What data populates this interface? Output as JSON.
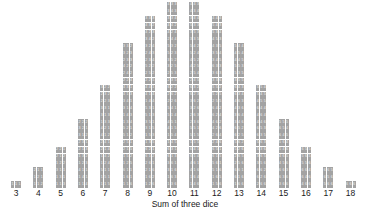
{
  "chart_data": {
    "type": "bar",
    "title": "",
    "subtitle": "",
    "xlabel": "Sum of three dice",
    "ylabel": "",
    "grid": false,
    "legend": null,
    "annotations": [],
    "xlim": [
      3,
      18
    ],
    "ylim": [
      0,
      27
    ],
    "categories": [
      3,
      4,
      5,
      6,
      7,
      8,
      9,
      10,
      11,
      12,
      13,
      14,
      15,
      16,
      17,
      18
    ],
    "tick_labels": [
      "3",
      "4",
      "5",
      "6",
      "7",
      "8",
      "9",
      "10",
      "11",
      "12",
      "13",
      "14",
      "15",
      "16",
      "17",
      "18"
    ],
    "values": [
      1,
      3,
      6,
      10,
      15,
      21,
      25,
      27,
      27,
      25,
      21,
      15,
      10,
      6,
      3,
      1
    ],
    "total_outcomes": 216,
    "note": "Each stacked square is one ordered outcome of three dice; the three digits in a square are the faces of die 1, die 2 and die 3.",
    "columns": [
      {
        "sum": 3,
        "count": 1,
        "outcomes": [
          [
            1,
            1,
            1
          ]
        ]
      },
      {
        "sum": 4,
        "count": 3,
        "outcomes": [
          [
            1,
            1,
            2
          ],
          [
            1,
            2,
            1
          ],
          [
            2,
            1,
            1
          ]
        ]
      },
      {
        "sum": 5,
        "count": 6,
        "outcomes": [
          [
            1,
            1,
            3
          ],
          [
            1,
            3,
            1
          ],
          [
            3,
            1,
            1
          ],
          [
            1,
            2,
            2
          ],
          [
            2,
            1,
            2
          ],
          [
            2,
            2,
            1
          ]
        ]
      },
      {
        "sum": 6,
        "count": 10,
        "outcomes": [
          [
            1,
            1,
            4
          ],
          [
            1,
            4,
            1
          ],
          [
            4,
            1,
            1
          ],
          [
            1,
            2,
            3
          ],
          [
            1,
            3,
            2
          ],
          [
            2,
            1,
            3
          ],
          [
            2,
            3,
            1
          ],
          [
            3,
            1,
            2
          ],
          [
            3,
            2,
            1
          ],
          [
            2,
            2,
            2
          ]
        ]
      },
      {
        "sum": 7,
        "count": 15,
        "outcomes": [
          [
            1,
            1,
            5
          ],
          [
            1,
            5,
            1
          ],
          [
            5,
            1,
            1
          ],
          [
            1,
            2,
            4
          ],
          [
            1,
            4,
            2
          ],
          [
            2,
            1,
            4
          ],
          [
            2,
            4,
            1
          ],
          [
            4,
            1,
            2
          ],
          [
            4,
            2,
            1
          ],
          [
            1,
            3,
            3
          ],
          [
            3,
            1,
            3
          ],
          [
            3,
            3,
            1
          ],
          [
            2,
            2,
            3
          ],
          [
            2,
            3,
            2
          ],
          [
            3,
            2,
            2
          ]
        ]
      },
      {
        "sum": 8,
        "count": 21,
        "outcomes": [
          [
            1,
            1,
            6
          ],
          [
            1,
            6,
            1
          ],
          [
            6,
            1,
            1
          ],
          [
            1,
            2,
            5
          ],
          [
            1,
            5,
            2
          ],
          [
            2,
            1,
            5
          ],
          [
            2,
            5,
            1
          ],
          [
            5,
            1,
            2
          ],
          [
            5,
            2,
            1
          ],
          [
            1,
            3,
            4
          ],
          [
            1,
            4,
            3
          ],
          [
            3,
            1,
            4
          ],
          [
            3,
            4,
            1
          ],
          [
            4,
            1,
            3
          ],
          [
            4,
            3,
            1
          ],
          [
            2,
            2,
            4
          ],
          [
            2,
            4,
            2
          ],
          [
            4,
            2,
            2
          ],
          [
            2,
            3,
            3
          ],
          [
            3,
            2,
            3
          ],
          [
            3,
            3,
            2
          ]
        ]
      },
      {
        "sum": 9,
        "count": 25,
        "outcomes": [
          [
            1,
            2,
            6
          ],
          [
            1,
            6,
            2
          ],
          [
            2,
            1,
            6
          ],
          [
            2,
            6,
            1
          ],
          [
            6,
            1,
            2
          ],
          [
            6,
            2,
            1
          ],
          [
            1,
            3,
            5
          ],
          [
            1,
            5,
            3
          ],
          [
            3,
            1,
            5
          ],
          [
            3,
            5,
            1
          ],
          [
            5,
            1,
            3
          ],
          [
            5,
            3,
            1
          ],
          [
            1,
            4,
            4
          ],
          [
            4,
            1,
            4
          ],
          [
            4,
            4,
            1
          ],
          [
            2,
            2,
            5
          ],
          [
            2,
            5,
            2
          ],
          [
            5,
            2,
            2
          ],
          [
            2,
            3,
            4
          ],
          [
            2,
            4,
            3
          ],
          [
            3,
            2,
            4
          ],
          [
            3,
            4,
            2
          ],
          [
            4,
            2,
            3
          ],
          [
            4,
            3,
            2
          ],
          [
            3,
            3,
            3
          ]
        ]
      },
      {
        "sum": 10,
        "count": 27,
        "outcomes": [
          [
            1,
            3,
            6
          ],
          [
            1,
            6,
            3
          ],
          [
            3,
            1,
            6
          ],
          [
            3,
            6,
            1
          ],
          [
            6,
            1,
            3
          ],
          [
            6,
            3,
            1
          ],
          [
            1,
            4,
            5
          ],
          [
            1,
            5,
            4
          ],
          [
            4,
            1,
            5
          ],
          [
            4,
            5,
            1
          ],
          [
            5,
            1,
            4
          ],
          [
            5,
            4,
            1
          ],
          [
            2,
            2,
            6
          ],
          [
            2,
            6,
            2
          ],
          [
            6,
            2,
            2
          ],
          [
            2,
            3,
            5
          ],
          [
            2,
            5,
            3
          ],
          [
            3,
            2,
            5
          ],
          [
            3,
            5,
            2
          ],
          [
            5,
            2,
            3
          ],
          [
            5,
            3,
            2
          ],
          [
            2,
            4,
            4
          ],
          [
            4,
            2,
            4
          ],
          [
            4,
            4,
            2
          ],
          [
            3,
            3,
            4
          ],
          [
            3,
            4,
            3
          ],
          [
            4,
            3,
            3
          ]
        ]
      },
      {
        "sum": 11,
        "count": 27,
        "outcomes": [
          [
            1,
            4,
            6
          ],
          [
            1,
            6,
            4
          ],
          [
            4,
            1,
            6
          ],
          [
            4,
            6,
            1
          ],
          [
            6,
            1,
            4
          ],
          [
            6,
            4,
            1
          ],
          [
            1,
            5,
            5
          ],
          [
            5,
            1,
            5
          ],
          [
            5,
            5,
            1
          ],
          [
            2,
            3,
            6
          ],
          [
            2,
            6,
            3
          ],
          [
            3,
            2,
            6
          ],
          [
            3,
            6,
            2
          ],
          [
            6,
            2,
            3
          ],
          [
            6,
            3,
            2
          ],
          [
            2,
            4,
            5
          ],
          [
            2,
            5,
            4
          ],
          [
            4,
            2,
            5
          ],
          [
            4,
            5,
            2
          ],
          [
            5,
            2,
            4
          ],
          [
            5,
            4,
            2
          ],
          [
            3,
            3,
            5
          ],
          [
            3,
            5,
            3
          ],
          [
            5,
            3,
            3
          ],
          [
            3,
            4,
            4
          ],
          [
            4,
            3,
            4
          ],
          [
            4,
            4,
            3
          ]
        ]
      },
      {
        "sum": 12,
        "count": 25,
        "outcomes": [
          [
            1,
            5,
            6
          ],
          [
            1,
            6,
            5
          ],
          [
            5,
            1,
            6
          ],
          [
            5,
            6,
            1
          ],
          [
            6,
            1,
            5
          ],
          [
            6,
            5,
            1
          ],
          [
            2,
            4,
            6
          ],
          [
            2,
            6,
            4
          ],
          [
            4,
            2,
            6
          ],
          [
            4,
            6,
            2
          ],
          [
            6,
            2,
            4
          ],
          [
            6,
            4,
            2
          ],
          [
            2,
            5,
            5
          ],
          [
            5,
            2,
            5
          ],
          [
            5,
            5,
            2
          ],
          [
            3,
            3,
            6
          ],
          [
            3,
            6,
            3
          ],
          [
            6,
            3,
            3
          ],
          [
            3,
            4,
            5
          ],
          [
            3,
            5,
            4
          ],
          [
            4,
            3,
            5
          ],
          [
            4,
            5,
            3
          ],
          [
            5,
            3,
            4
          ],
          [
            5,
            4,
            3
          ],
          [
            4,
            4,
            4
          ]
        ]
      },
      {
        "sum": 13,
        "count": 21,
        "outcomes": [
          [
            1,
            6,
            6
          ],
          [
            6,
            1,
            6
          ],
          [
            6,
            6,
            1
          ],
          [
            2,
            5,
            6
          ],
          [
            2,
            6,
            5
          ],
          [
            5,
            2,
            6
          ],
          [
            5,
            6,
            2
          ],
          [
            6,
            2,
            5
          ],
          [
            6,
            5,
            2
          ],
          [
            3,
            4,
            6
          ],
          [
            3,
            6,
            4
          ],
          [
            4,
            3,
            6
          ],
          [
            4,
            6,
            3
          ],
          [
            6,
            3,
            4
          ],
          [
            6,
            4,
            3
          ],
          [
            3,
            5,
            5
          ],
          [
            5,
            3,
            5
          ],
          [
            5,
            5,
            3
          ],
          [
            4,
            4,
            5
          ],
          [
            4,
            5,
            4
          ],
          [
            5,
            4,
            4
          ]
        ]
      },
      {
        "sum": 14,
        "count": 15,
        "outcomes": [
          [
            2,
            6,
            6
          ],
          [
            6,
            2,
            6
          ],
          [
            6,
            6,
            2
          ],
          [
            3,
            5,
            6
          ],
          [
            3,
            6,
            5
          ],
          [
            5,
            3,
            6
          ],
          [
            5,
            6,
            3
          ],
          [
            6,
            3,
            5
          ],
          [
            6,
            5,
            3
          ],
          [
            4,
            4,
            6
          ],
          [
            4,
            6,
            4
          ],
          [
            6,
            4,
            4
          ],
          [
            4,
            5,
            5
          ],
          [
            5,
            4,
            5
          ],
          [
            5,
            5,
            4
          ]
        ]
      },
      {
        "sum": 15,
        "count": 10,
        "outcomes": [
          [
            3,
            6,
            6
          ],
          [
            6,
            3,
            6
          ],
          [
            6,
            6,
            3
          ],
          [
            4,
            5,
            6
          ],
          [
            4,
            6,
            5
          ],
          [
            5,
            4,
            6
          ],
          [
            5,
            6,
            4
          ],
          [
            6,
            4,
            5
          ],
          [
            6,
            5,
            4
          ],
          [
            5,
            5,
            5
          ]
        ]
      },
      {
        "sum": 16,
        "count": 6,
        "outcomes": [
          [
            4,
            6,
            6
          ],
          [
            6,
            4,
            6
          ],
          [
            6,
            6,
            4
          ],
          [
            5,
            5,
            6
          ],
          [
            5,
            6,
            5
          ],
          [
            6,
            5,
            5
          ]
        ]
      },
      {
        "sum": 17,
        "count": 3,
        "outcomes": [
          [
            5,
            6,
            6
          ],
          [
            6,
            5,
            6
          ],
          [
            6,
            6,
            5
          ]
        ]
      },
      {
        "sum": 18,
        "count": 1,
        "outcomes": [
          [
            6,
            6,
            6
          ]
        ]
      }
    ]
  },
  "colors": {
    "cell": "#a3a3a3",
    "cell_text": "#f2f2f2",
    "background": "#ffffff",
    "axis_text": "#1a1a1a"
  }
}
